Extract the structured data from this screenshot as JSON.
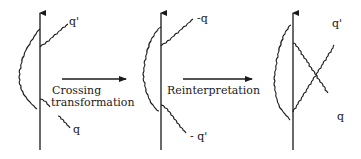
{
  "diagram": {
    "panels": [
      {
        "id": "initial",
        "labels": {
          "upper": "q'",
          "lower": "q"
        }
      },
      {
        "id": "crossed",
        "labels": {
          "upper": "-q",
          "lower": "- q'"
        }
      },
      {
        "id": "reinterpreted",
        "labels": {
          "upper": "q'",
          "lower": "q"
        }
      }
    ],
    "transitions": [
      {
        "line1": "Crossing",
        "line2": "transformation"
      },
      {
        "line1": "Reinterpretation"
      }
    ]
  }
}
